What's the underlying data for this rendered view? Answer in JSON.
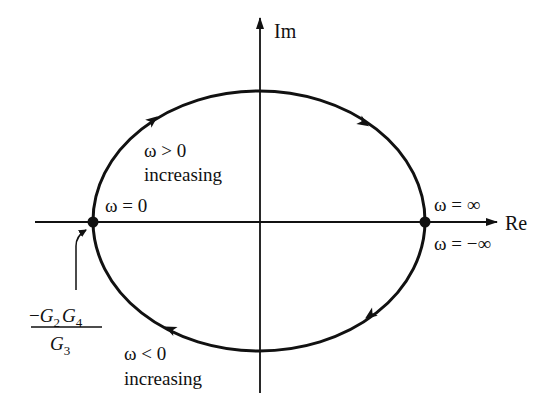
{
  "diagram": {
    "type": "nyquist-plot",
    "axes": {
      "x_label": "Re",
      "y_label": "Im"
    },
    "labels": {
      "omega_zero": "ω = 0",
      "omega_inf": "ω = ∞",
      "omega_neg_inf": "ω = −∞",
      "omega_pos_1": "ω > 0",
      "omega_pos_2": "increasing",
      "omega_neg_1": "ω < 0",
      "omega_neg_2": "increasing"
    },
    "fraction": {
      "numerator_sign": "−",
      "num_G1": "G",
      "num_sub1": "2",
      "num_G2": "G",
      "num_sub2": "4",
      "den_G": "G",
      "den_sub": "3"
    },
    "contour": {
      "shape": "ellipse",
      "direction": "clockwise",
      "points": [
        "ω = 0 at left real-axis crossing (−G2G4/G3)",
        "ω = ±∞ at right real-axis crossing"
      ]
    },
    "colors": {
      "stroke": "#111111",
      "background": "#ffffff"
    }
  }
}
